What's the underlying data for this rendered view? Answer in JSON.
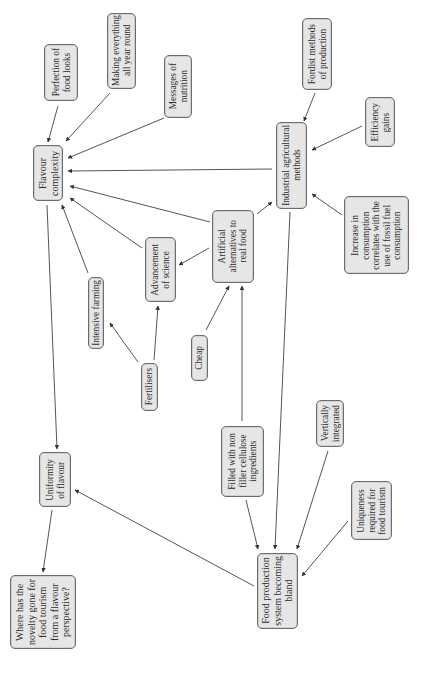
{
  "diagram": {
    "type": "concept-map",
    "orientation": "rotated 90 degrees counter-clockwise",
    "colors": {
      "node_fill": "#e6e6e6",
      "node_border": "#6d6d6d",
      "edge": "#555555",
      "text": "#2b2b2b"
    },
    "nodes": {
      "perfection": {
        "label": "Perfection of\nfood looks"
      },
      "all_year": {
        "label": "Making everything\nall year round"
      },
      "nutrition": {
        "label": "Messages of\nnutrition"
      },
      "flavour_complexity": {
        "label": "Flavour\ncomplexity"
      },
      "fordist": {
        "label": "Fordist methods\nof production"
      },
      "efficiency": {
        "label": "Efficiency\ngains"
      },
      "industrial": {
        "label": "Industrial agricultural\nmethods"
      },
      "consumption": {
        "label": "Increase in\nconsumption\ncorrelates with the\nuse of fossil fuel\nconsumption"
      },
      "artificial": {
        "label": "Artificial\nalternatives to\nreal food"
      },
      "science": {
        "label": "Advancement\nof science"
      },
      "intensive": {
        "label": "Intensive farming"
      },
      "fertilisers": {
        "label": "Fertilisers"
      },
      "cheap": {
        "label": "Cheap"
      },
      "filled": {
        "label": "Filled with non\nfiller cellulose\ningredients"
      },
      "vertical": {
        "label": "Vertically\nintegrated"
      },
      "uniqueness": {
        "label": "Uniqueness\nrequired for\nfood tourism"
      },
      "uniformity": {
        "label": "Uniformity\nof flavour"
      },
      "bland": {
        "label": "Food production\nsystem becoming\nbland"
      },
      "novelty": {
        "label": "Where has the\nnovelty gone for\nfood tourism\nfrom a flavour\nperspective?"
      }
    },
    "edges": [
      {
        "from": "Perfection of food looks",
        "to": "Flavour complexity"
      },
      {
        "from": "Making everything all year round",
        "to": "Flavour complexity"
      },
      {
        "from": "Messages of nutrition",
        "to": "Flavour complexity"
      },
      {
        "from": "Industrial agricultural methods",
        "to": "Flavour complexity"
      },
      {
        "from": "Artificial alternatives to real food",
        "to": "Flavour complexity"
      },
      {
        "from": "Advancement of science",
        "to": "Flavour complexity"
      },
      {
        "from": "Intensive farming",
        "to": "Flavour complexity"
      },
      {
        "from": "Fordist methods of production",
        "to": "Industrial agricultural methods"
      },
      {
        "from": "Efficiency gains",
        "to": "Industrial agricultural methods"
      },
      {
        "from": "Increase in consumption correlates with the use of fossil fuel consumption",
        "to": "Industrial agricultural methods"
      },
      {
        "from": "Artificial alternatives to real food",
        "to": "Industrial agricultural methods"
      },
      {
        "from": "Artificial alternatives to real food",
        "to": "Advancement of science"
      },
      {
        "from": "Fertilisers",
        "to": "Intensive farming"
      },
      {
        "from": "Fertilisers",
        "to": "Advancement of science"
      },
      {
        "from": "Cheap",
        "to": "Artificial alternatives to real food"
      },
      {
        "from": "Filled with non filler cellulose ingredients",
        "to": "Artificial alternatives to real food"
      },
      {
        "from": "Flavour complexity",
        "to": "Uniformity of flavour"
      },
      {
        "from": "Industrial agricultural methods",
        "to": "Food production system becoming bland"
      },
      {
        "from": "Filled with non filler cellulose ingredients",
        "to": "Food production system becoming bland"
      },
      {
        "from": "Vertically integrated",
        "to": "Food production system becoming bland"
      },
      {
        "from": "Uniqueness required for food tourism",
        "to": "Food production system becoming bland"
      },
      {
        "from": "Food production system becoming bland",
        "to": "Uniformity of flavour"
      },
      {
        "from": "Uniformity of flavour",
        "to": "Where has the novelty gone for food tourism from a flavour perspective?"
      }
    ]
  }
}
